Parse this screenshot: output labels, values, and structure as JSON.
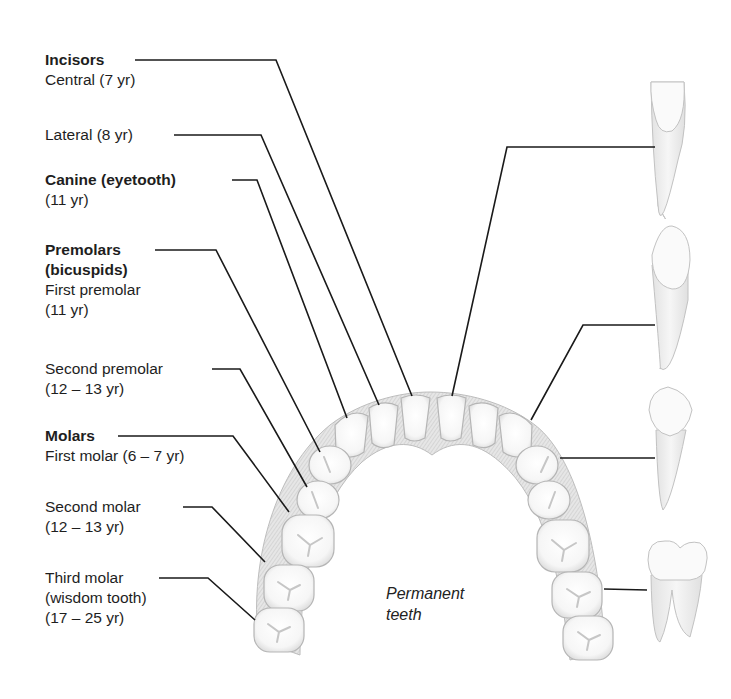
{
  "diagram": {
    "caption": [
      "Permanent",
      "teeth"
    ],
    "groups": [
      {
        "heading": "Incisors",
        "items": [
          {
            "name": "Central (7 yr)"
          },
          {
            "name": "Lateral (8 yr)"
          }
        ]
      },
      {
        "heading": "Canine (eyetooth)",
        "items": [
          {
            "name": "(11 yr)"
          }
        ]
      },
      {
        "heading": "Premolars",
        "heading2": "(bicuspids)",
        "items": [
          {
            "name": "First premolar",
            "age": "(11 yr)"
          },
          {
            "name": "Second premolar",
            "age": "(12 – 13 yr)"
          }
        ]
      },
      {
        "heading": "Molars",
        "items": [
          {
            "name": "First molar (6 – 7 yr)"
          },
          {
            "name": "Second molar",
            "age": "(12 – 13 yr)"
          },
          {
            "name": "Third molar",
            "age": "(wisdom tooth)",
            "age2": "(17 – 25 yr)"
          }
        ]
      }
    ],
    "side_teeth": [
      "incisor",
      "canine",
      "premolar",
      "molar"
    ],
    "colors": {
      "line": "#1a1a1a",
      "tooth_fill": "#fbfbfb",
      "tooth_stroke": "#b8b8b8",
      "gum_fill": "#dcdcdc",
      "root_fill": "#f0f0f0"
    }
  }
}
